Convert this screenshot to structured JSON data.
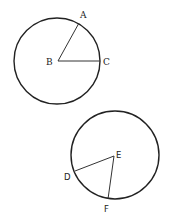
{
  "diagram": {
    "circle1": {
      "center_label": "B",
      "points": [
        {
          "label": "A"
        },
        {
          "label": "C"
        }
      ]
    },
    "circle2": {
      "center_label": "E",
      "points": [
        {
          "label": "D"
        },
        {
          "label": "F"
        }
      ]
    },
    "stroke_color": "#222222"
  }
}
